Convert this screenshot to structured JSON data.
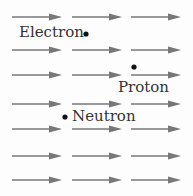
{
  "diagram": {
    "field": {
      "arrow_color": "#777777",
      "direction": "right",
      "rows_y": [
        17,
        50,
        75,
        104,
        129,
        156,
        180
      ],
      "columns": [
        {
          "x1": 12,
          "x2": 62
        },
        {
          "x1": 72,
          "x2": 122
        },
        {
          "x1": 131,
          "x2": 181
        }
      ]
    },
    "particles": [
      {
        "name": "Electron",
        "label": "Electron",
        "dot_x": 86,
        "dot_y": 34,
        "label_x": 19,
        "label_y": 25
      },
      {
        "name": "Proton",
        "label": "Proton",
        "dot_x": 134,
        "dot_y": 67,
        "label_x": 118,
        "label_y": 80
      },
      {
        "name": "Neutron",
        "label": "Neutron",
        "dot_x": 65,
        "dot_y": 117,
        "label_x": 72,
        "label_y": 109
      }
    ],
    "dot_color": "#111111"
  }
}
